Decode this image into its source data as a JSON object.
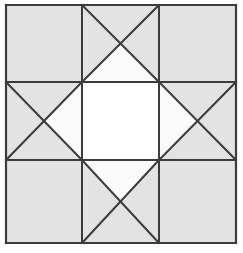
{
  "figure": {
    "width": 243,
    "height": 253,
    "background_color": "#ffffff"
  },
  "style": {
    "line_color": "#3c3c3c",
    "outer_line_width": 2.2,
    "grid_line_width": 2.0,
    "diagonal_line_width": 2.0,
    "fill_gray": "#e3e3e3",
    "fill_white": "#fbfbfb",
    "center_white": "#ffffff"
  },
  "geometry": {
    "left": 6,
    "top": 5,
    "right": 236,
    "bottom": 243,
    "x_divisions": [
      6,
      82,
      159,
      236
    ],
    "y_divisions": [
      5,
      82,
      160,
      243
    ]
  },
  "cells": [
    {
      "name": "top-left",
      "row": 0,
      "col": 0,
      "pattern": "plain",
      "fill": "gray",
      "triangles": []
    },
    {
      "name": "top-center",
      "row": 0,
      "col": 1,
      "pattern": "hourglass-x",
      "fill": "mixed",
      "triangles": [
        {
          "position": "top",
          "fill": "gray"
        },
        {
          "position": "left",
          "fill": "gray"
        },
        {
          "position": "right",
          "fill": "gray"
        },
        {
          "position": "bottom",
          "fill": "white"
        }
      ]
    },
    {
      "name": "top-right",
      "row": 0,
      "col": 2,
      "pattern": "plain",
      "fill": "gray",
      "triangles": []
    },
    {
      "name": "middle-left",
      "row": 1,
      "col": 0,
      "pattern": "hourglass-x",
      "fill": "mixed",
      "triangles": [
        {
          "position": "top",
          "fill": "gray"
        },
        {
          "position": "left",
          "fill": "gray"
        },
        {
          "position": "bottom",
          "fill": "gray"
        },
        {
          "position": "right",
          "fill": "white"
        }
      ]
    },
    {
      "name": "middle-center",
      "row": 1,
      "col": 1,
      "pattern": "plain",
      "fill": "white",
      "triangles": []
    },
    {
      "name": "middle-right",
      "row": 1,
      "col": 2,
      "pattern": "hourglass-x",
      "fill": "mixed",
      "triangles": [
        {
          "position": "top",
          "fill": "gray"
        },
        {
          "position": "right",
          "fill": "gray"
        },
        {
          "position": "bottom",
          "fill": "gray"
        },
        {
          "position": "left",
          "fill": "white"
        }
      ]
    },
    {
      "name": "bottom-left",
      "row": 2,
      "col": 0,
      "pattern": "plain",
      "fill": "gray",
      "triangles": []
    },
    {
      "name": "bottom-center",
      "row": 2,
      "col": 1,
      "pattern": "hourglass-x",
      "fill": "mixed",
      "triangles": [
        {
          "position": "bottom",
          "fill": "gray"
        },
        {
          "position": "left",
          "fill": "gray"
        },
        {
          "position": "right",
          "fill": "gray"
        },
        {
          "position": "top",
          "fill": "white"
        }
      ]
    },
    {
      "name": "bottom-right",
      "row": 2,
      "col": 2,
      "pattern": "plain",
      "fill": "gray",
      "triangles": []
    }
  ]
}
